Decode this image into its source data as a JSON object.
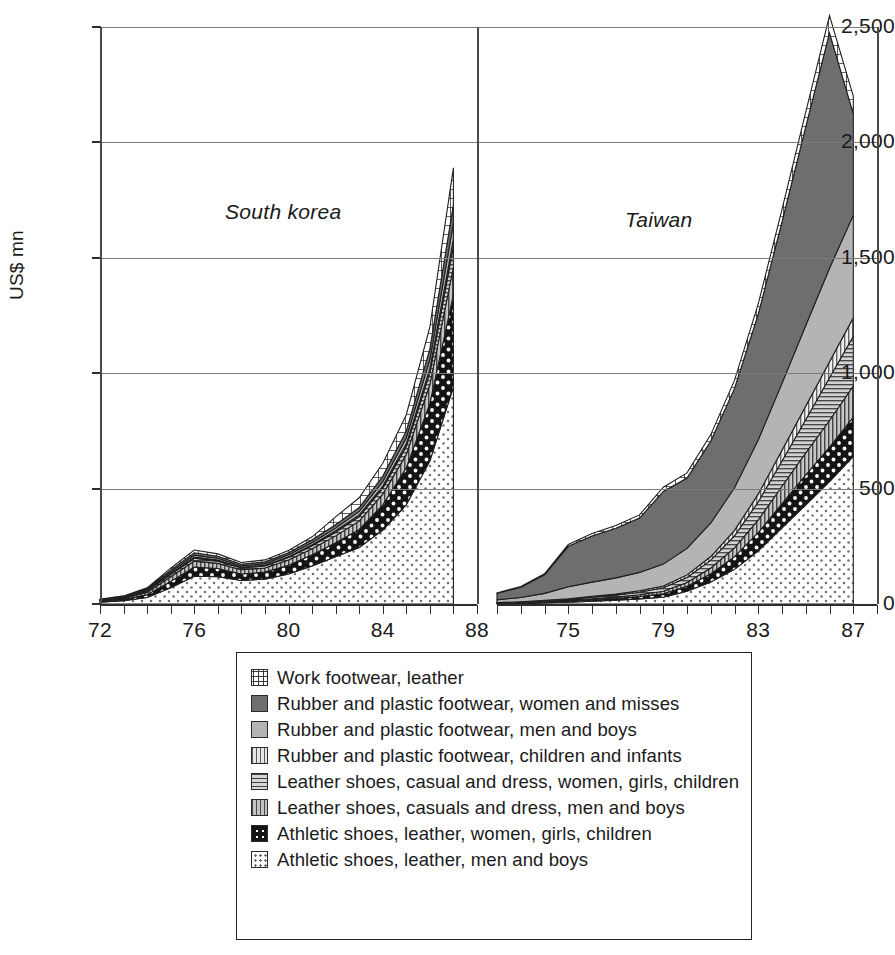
{
  "axes": {
    "ylabel": "US$ mn",
    "yticks": [
      "0",
      "500",
      "1,000",
      "1,500",
      "2,000",
      "2,500"
    ],
    "ytick_values": [
      0,
      500,
      1000,
      1500,
      2000,
      2500
    ],
    "ylim": [
      0,
      2500
    ]
  },
  "panels": [
    {
      "title": "South korea",
      "xticks": [
        "72",
        "76",
        "80",
        "84",
        "88"
      ],
      "xtick_values": [
        1972,
        1976,
        1980,
        1984,
        1988
      ],
      "xlim": [
        1972,
        1988
      ]
    },
    {
      "title": "Taiwan",
      "xticks": [
        "75",
        "79",
        "83",
        "87"
      ],
      "xtick_values": [
        1975,
        1979,
        1983,
        1987
      ],
      "xlim": [
        1972,
        1988
      ]
    }
  ],
  "legend": {
    "items": [
      {
        "label": "Work footwear, leather",
        "pattern": "grid",
        "color": "#ffffff"
      },
      {
        "label": "Rubber and plastic footwear, women and misses",
        "pattern": "solid-dark-gray",
        "color": "#6e6e6e"
      },
      {
        "label": "Rubber and plastic footwear, men and boys",
        "pattern": "solid-light-gray",
        "color": "#b4b4b4"
      },
      {
        "label": "Rubber and plastic footwear, children and infants",
        "pattern": "vertical-stripe-light",
        "color": "#e6e6e6"
      },
      {
        "label": "Leather shoes, casual and dress, women, girls, children",
        "pattern": "horizontal-stripe",
        "color": "#d6d6d6"
      },
      {
        "label": "Leather shoes, casuals and dress, men and boys",
        "pattern": "vertical-stripe-medium",
        "color": "#c2c2c2"
      },
      {
        "label": "Athletic shoes, leather, women, girls, children",
        "pattern": "black-with-white-dots",
        "color": "#141414"
      },
      {
        "label": "Athletic shoes, leather, men and boys",
        "pattern": "white-with-dots",
        "color": "#ffffff"
      }
    ]
  },
  "chart_data": {
    "type": "area",
    "stacked": true,
    "title": "",
    "xlabel": "",
    "ylabel": "US$ mn",
    "ylim": [
      0,
      2500
    ],
    "grid": true,
    "legend_position": "bottom",
    "panels": [
      {
        "name": "South korea",
        "x": [
          1972,
          1973,
          1974,
          1975,
          1976,
          1977,
          1978,
          1979,
          1980,
          1981,
          1982,
          1983,
          1984,
          1985,
          1986,
          1987
        ],
        "series": [
          {
            "name": "Athletic shoes, leather, men and boys",
            "values": [
              8,
              14,
              28,
              70,
              120,
              118,
              102,
              108,
              130,
              165,
              205,
              245,
              320,
              430,
              620,
              940
            ]
          },
          {
            "name": "Athletic shoes, leather, women, girls, children",
            "values": [
              4,
              6,
              12,
              28,
              40,
              36,
              28,
              30,
              38,
              48,
              60,
              78,
              110,
              160,
              250,
              400
            ]
          },
          {
            "name": "Leather shoes, casuals and dress, men and boys",
            "values": [
              3,
              5,
              10,
              20,
              26,
              22,
              18,
              18,
              22,
              26,
              30,
              36,
              46,
              58,
              82,
              120
            ]
          },
          {
            "name": "Leather shoes, casual and dress, women, girls, children",
            "values": [
              2,
              3,
              6,
              10,
              12,
              10,
              8,
              9,
              11,
              13,
              16,
              20,
              26,
              34,
              50,
              90
            ]
          },
          {
            "name": "Rubber and plastic footwear, children and infants",
            "values": [
              1,
              1,
              2,
              4,
              5,
              4,
              3,
              3,
              4,
              5,
              6,
              7,
              9,
              12,
              18,
              30
            ]
          },
          {
            "name": "Rubber and plastic footwear, men and boys",
            "values": [
              1,
              2,
              4,
              7,
              9,
              8,
              6,
              7,
              8,
              10,
              12,
              15,
              20,
              26,
              40,
              70
            ]
          },
          {
            "name": "Rubber and plastic footwear, women and misses",
            "values": [
              1,
              2,
              4,
              8,
              10,
              9,
              7,
              8,
              9,
              11,
              14,
              17,
              23,
              30,
              46,
              80
            ]
          },
          {
            "name": "Work footwear, leather",
            "values": [
              1,
              2,
              4,
              8,
              12,
              10,
              8,
              8,
              10,
              13,
              35,
              42,
              56,
              70,
              95,
              160
            ]
          }
        ],
        "totals": [
          21,
          35,
          70,
          155,
          234,
          217,
          180,
          191,
          232,
          291,
          378,
          460,
          610,
          820,
          1201,
          1890
        ]
      },
      {
        "name": "Taiwan",
        "x": [
          1972,
          1973,
          1974,
          1975,
          1976,
          1977,
          1978,
          1979,
          1980,
          1981,
          1982,
          1983,
          1984,
          1985,
          1986,
          1987
        ],
        "series": [
          {
            "name": "Athletic shoes, leather, men and boys",
            "values": [
              2,
              3,
              5,
              8,
              12,
              16,
              22,
              30,
              55,
              95,
              150,
              230,
              330,
              430,
              530,
              640
            ]
          },
          {
            "name": "Athletic shoes, leather, women, girls, children",
            "values": [
              1,
              2,
              3,
              4,
              6,
              8,
              10,
              14,
              22,
              36,
              55,
              80,
              105,
              130,
              150,
              170
            ]
          },
          {
            "name": "Leather shoes, casuals and dress, men and boys",
            "values": [
              1,
              2,
              3,
              4,
              5,
              6,
              8,
              11,
              16,
              25,
              38,
              55,
              75,
              95,
              115,
              135
            ]
          },
          {
            "name": "Leather shoes, casual and dress, women, girls, children",
            "values": [
              1,
              2,
              3,
              4,
              6,
              8,
              11,
              15,
              22,
              34,
              52,
              78,
              110,
              145,
              185,
              215
            ]
          },
          {
            "name": "Rubber and plastic footwear, children and infants",
            "values": [
              1,
              1,
              2,
              3,
              4,
              5,
              6,
              8,
              11,
              16,
              24,
              34,
              46,
              58,
              70,
              80
            ]
          },
          {
            "name": "Rubber and plastic footwear, men and boys",
            "values": [
              12,
              18,
              30,
              52,
              62,
              70,
              80,
              95,
              115,
              145,
              185,
              235,
              290,
              350,
              405,
              445
            ]
          },
          {
            "name": "Rubber and plastic footwear, women and misses",
            "values": [
              28,
              45,
              80,
              175,
              200,
              215,
              235,
              315,
              305,
              355,
              430,
              545,
              700,
              860,
              1020,
              440
            ]
          },
          {
            "name": "Work footwear, leather",
            "values": [
              2,
              3,
              5,
              8,
              10,
              12,
              14,
              18,
              22,
              28,
              35,
              44,
              54,
              64,
              75,
              75
            ]
          }
        ],
        "totals": [
          48,
          76,
          131,
          258,
          305,
          340,
          386,
          506,
          568,
          734,
          969,
          1301,
          1710,
          2132,
          2550,
          2200
        ]
      }
    ]
  }
}
